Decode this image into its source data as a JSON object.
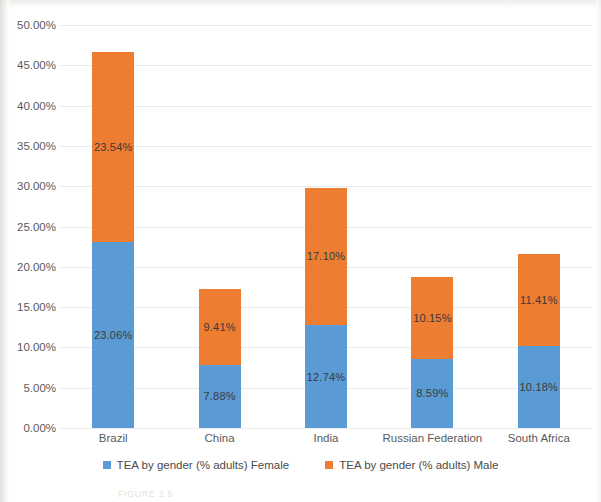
{
  "chart_data": {
    "type": "bar",
    "stacked": true,
    "title": "",
    "xlabel": "",
    "ylabel": "",
    "categories": [
      "Brazil",
      "China",
      "India",
      "Russian Federation",
      "South Africa"
    ],
    "series": [
      {
        "name": "TEA by gender (% adults) Female",
        "color": "#5B9BD5",
        "values": [
          23.06,
          7.88,
          12.74,
          8.59,
          10.18
        ],
        "labels": [
          "23.06%",
          "7.88%",
          "12.74%",
          "8.59%",
          "10.18%"
        ]
      },
      {
        "name": "TEA by gender (% adults) Male",
        "color": "#ED7D31",
        "values": [
          23.54,
          9.41,
          17.1,
          10.15,
          11.41
        ],
        "labels": [
          "23.54%",
          "9.41%",
          "17.10%",
          "10.15%",
          "11.41%"
        ]
      }
    ],
    "totals": [
      46.6,
      17.29,
      29.84,
      18.74,
      21.59
    ],
    "ylim": [
      0,
      50
    ],
    "ytick_step": 5,
    "ytick_labels": [
      "0.00%",
      "5.00%",
      "10.00%",
      "15.00%",
      "20.00%",
      "25.00%",
      "30.00%",
      "35.00%",
      "40.00%",
      "45.00%",
      "50.00%"
    ],
    "ytick_values": [
      0,
      5,
      10,
      15,
      20,
      25,
      30,
      35,
      40,
      45,
      50
    ],
    "grid": true,
    "grid_color": "#E9ECEF",
    "legend_position": "bottom"
  },
  "legend": {
    "items": [
      {
        "label": "TEA by gender (% adults) Female",
        "color": "#5B9BD5",
        "swatch_name": "legend-swatch-female"
      },
      {
        "label": "TEA by gender (% adults) Male",
        "color": "#ED7D31",
        "swatch_name": "legend-swatch-male"
      }
    ]
  },
  "caption": {
    "text": "FIGURE 2.5"
  }
}
